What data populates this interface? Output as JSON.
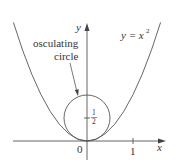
{
  "figure": {
    "curve_label": "y = x",
    "curve_exponent": "2",
    "circle_label_line1": "osculating",
    "circle_label_line2": "circle",
    "axis_x_label": "x",
    "axis_y_label": "y",
    "origin_label": "0",
    "x_tick_label": "1",
    "y_tick_numerator": "1",
    "y_tick_denominator": "2",
    "colors": {
      "stroke": "#555555",
      "text": "#333333"
    }
  }
}
